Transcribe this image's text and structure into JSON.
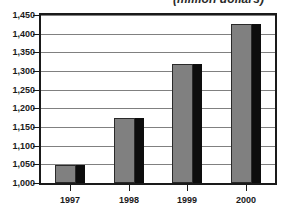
{
  "chart_data": {
    "type": "bar",
    "title": "(million dollars)",
    "title_note": "title is cropped at top edge of screenshot",
    "xlabel": "",
    "ylabel": "",
    "categories": [
      "1997",
      "1998",
      "1999",
      "2000"
    ],
    "values": [
      1048,
      1175,
      1320,
      1425
    ],
    "series": [
      {
        "name": "",
        "values": [
          1048,
          1175,
          1320,
          1425
        ]
      }
    ],
    "ylim": [
      1000,
      1450
    ],
    "ytick_step": 50,
    "ytick_labels": [
      "1,000",
      "1,050",
      "1,100",
      "1,150",
      "1,200",
      "1,250",
      "1,300",
      "1,350",
      "1,400",
      "1,450"
    ],
    "ytick_values": [
      1000,
      1050,
      1100,
      1150,
      1200,
      1250,
      1300,
      1350,
      1400,
      1450
    ],
    "grid": true,
    "grid_axis": "y",
    "legend": false,
    "legend_position": "none",
    "bar_color": "#808080",
    "bar_shadow_color": "#0d0d0d",
    "bar_border_color": "#2a2a2a",
    "gridline_color": "#808080",
    "frame_color": "#1a1a1a",
    "background_color": "#ffffff",
    "text_color": "#1a1a1a"
  }
}
